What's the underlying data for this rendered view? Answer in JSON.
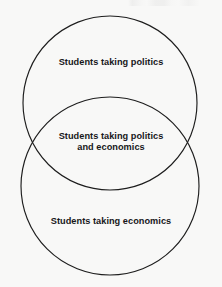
{
  "figure": {
    "type": "venn-diagram",
    "set_count": 2,
    "background_color": "#f8f8f7",
    "stroke_color": "#1d1d1d",
    "text_color": "#17171a"
  },
  "circles": [
    {
      "id": "politics-circle",
      "name": "politics-set",
      "cx": 110,
      "cy": 103,
      "r": 87
    },
    {
      "id": "economics-circle",
      "name": "economics-set",
      "cx": 110,
      "cy": 186,
      "r": 89
    }
  ],
  "labels": {
    "politics_only": "Students taking politics",
    "intersection": "Students taking politics\nand economics",
    "economics_only": "Students taking economics"
  }
}
